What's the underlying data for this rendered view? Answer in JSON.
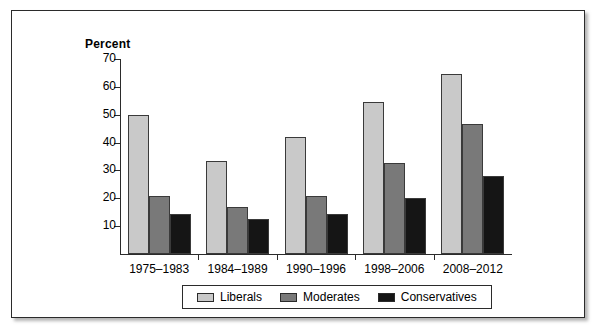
{
  "chart_data": {
    "type": "bar",
    "title": "",
    "ylabel": "Percent",
    "xlabel": "",
    "ylim": [
      0,
      70
    ],
    "yticks": [
      10,
      20,
      30,
      40,
      50,
      60,
      70
    ],
    "grid": false,
    "legend_position": "bottom",
    "categories": [
      "1975–1983",
      "1984–1989",
      "1990–1996",
      "1998–2006",
      "2008–2012"
    ],
    "series": [
      {
        "name": "Liberals",
        "color": "#c9c9c9",
        "values": [
          50,
          33.5,
          42,
          54.5,
          64.5
        ]
      },
      {
        "name": "Moderates",
        "color": "#797979",
        "values": [
          21,
          17,
          21,
          32.5,
          46.5
        ]
      },
      {
        "name": "Conservatives",
        "color": "#151515",
        "values": [
          14.5,
          12.5,
          14.5,
          20,
          28
        ]
      }
    ]
  },
  "legend": {
    "items": [
      {
        "label": "Liberals"
      },
      {
        "label": "Moderates"
      },
      {
        "label": "Conservatives"
      }
    ]
  }
}
